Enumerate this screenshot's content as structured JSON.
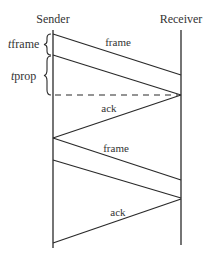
{
  "diagram": {
    "type": "sequence-timing",
    "colors": {
      "line": "#2a2a2a",
      "text": "#333333",
      "background": "#ffffff"
    },
    "actors": [
      {
        "name": "Sender",
        "x": 53
      },
      {
        "name": "Receiver",
        "x": 181
      }
    ],
    "timings": [
      {
        "symbol": "t",
        "subscript": "frame"
      },
      {
        "symbol": "t",
        "subscript": "prop"
      }
    ],
    "messages": [
      {
        "label": "frame",
        "direction": "sender-to-receiver"
      },
      {
        "label": "ack",
        "direction": "receiver-to-sender"
      },
      {
        "label": "frame",
        "direction": "sender-to-receiver"
      },
      {
        "label": "ack",
        "direction": "receiver-to-sender"
      }
    ]
  }
}
